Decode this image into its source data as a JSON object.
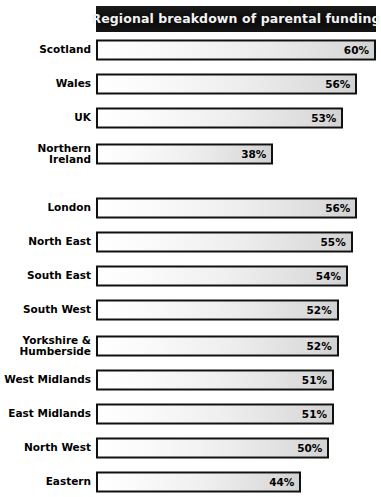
{
  "title": "Regional breakdown of parental funding",
  "colors": {
    "title_background": "#111111",
    "title_text": "#f2f2f2",
    "bar_border": "#111111",
    "bar_fill_start": "#ffffff",
    "bar_fill_end": "#d2d2d2",
    "page_background": "#ffffff",
    "label_text": "#000000"
  },
  "chart_data": {
    "type": "bar",
    "orientation": "horizontal",
    "title": "Regional breakdown of parental funding",
    "xlabel": "",
    "ylabel": "",
    "xlim": [
      0,
      60
    ],
    "grid": false,
    "legend": false,
    "value_suffix": "%",
    "groups": [
      {
        "name": "nations",
        "categories": [
          "Scotland",
          "Wales",
          "UK",
          "Northern\nIreland"
        ],
        "values": [
          60,
          56,
          53,
          38
        ],
        "labels": [
          "60%",
          "56%",
          "53%",
          "38%"
        ]
      },
      {
        "name": "english-regions",
        "categories": [
          "London",
          "North East",
          "South East",
          "South West",
          "Yorkshire &\nHumberside",
          "West Midlands",
          "East Midlands",
          "North West",
          "Eastern"
        ],
        "values": [
          56,
          55,
          54,
          52,
          52,
          51,
          51,
          50,
          44
        ],
        "labels": [
          "56%",
          "55%",
          "54%",
          "52%",
          "52%",
          "51%",
          "51%",
          "50%",
          "44%"
        ]
      }
    ]
  }
}
